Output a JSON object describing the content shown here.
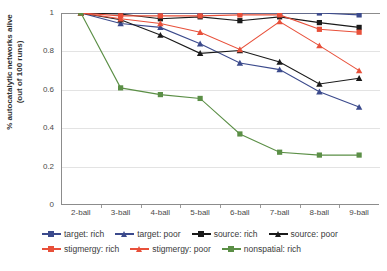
{
  "chart_data": {
    "type": "line",
    "title": "",
    "subtitle": "",
    "xlabel": "",
    "ylabel": "% autocatalytic networks alive (out of 100 runs)",
    "ylabel_line1": "% autocatalytic networks alive",
    "ylabel_line2": "(out of 100 runs)",
    "categories": [
      "2-ball",
      "3-ball",
      "4-ball",
      "5-ball",
      "6-ball",
      "7-ball",
      "8-ball",
      "9-ball"
    ],
    "ylim": [
      0,
      1
    ],
    "yticks": [
      0,
      0.2,
      0.4,
      0.6,
      0.8,
      1
    ],
    "ytick_labels": [
      "0",
      "0.2",
      "0.4",
      "0.6",
      "0.8",
      "1"
    ],
    "grid": true,
    "legend_position": "bottom",
    "series": [
      {
        "name": "target: rich",
        "color": "#3b4a8c",
        "marker": "square",
        "values": [
          1.0,
          1.0,
          1.0,
          1.0,
          1.0,
          1.0,
          1.0,
          0.99
        ]
      },
      {
        "name": "target: poor",
        "color": "#3b4a8c",
        "marker": "triangle",
        "values": [
          1.0,
          0.945,
          0.925,
          0.84,
          0.74,
          0.705,
          0.59,
          0.51
        ]
      },
      {
        "name": "source: rich",
        "color": "#1a1a1a",
        "marker": "square",
        "values": [
          1.0,
          0.995,
          0.97,
          0.98,
          0.96,
          0.98,
          0.95,
          0.925
        ]
      },
      {
        "name": "source: poor",
        "color": "#1a1a1a",
        "marker": "triangle",
        "values": [
          1.0,
          0.965,
          0.885,
          0.79,
          0.805,
          0.745,
          0.63,
          0.66
        ]
      },
      {
        "name": "stigmergy: rich",
        "color": "#e8503a",
        "marker": "square",
        "values": [
          1.0,
          0.985,
          0.985,
          0.985,
          0.99,
          0.99,
          0.915,
          0.9
        ]
      },
      {
        "name": "stigmergy: poor",
        "color": "#e8503a",
        "marker": "triangle",
        "values": [
          1.0,
          0.97,
          0.945,
          0.9,
          0.81,
          0.955,
          0.83,
          0.7
        ]
      },
      {
        "name": "nonspatial: rich",
        "color": "#5b8f46",
        "marker": "square",
        "values": [
          1.0,
          0.61,
          0.575,
          0.555,
          0.37,
          0.275,
          0.26,
          0.26
        ]
      }
    ]
  },
  "legend": {
    "rows": [
      [
        "target: rich",
        "target: poor",
        "source: rich",
        "source: poor"
      ],
      [
        "stigmergy: rich",
        "stigmergy: poor",
        "nonspatial: rich"
      ]
    ]
  }
}
